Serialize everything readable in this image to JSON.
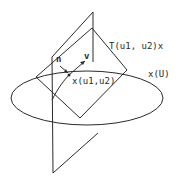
{
  "diagram": {
    "labels": {
      "tangent_plane": "T(u1, u2)x",
      "surface": "x(U)",
      "point": "x(u1,u2)",
      "normal": "n",
      "vector": "v"
    },
    "colors": {
      "stroke": "#2a2a2a",
      "background": "#ffffff"
    }
  }
}
